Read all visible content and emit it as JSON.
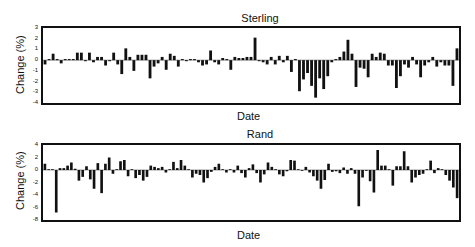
{
  "chart_data": [
    {
      "type": "bar",
      "title": "Sterling",
      "xlabel": "Date",
      "ylabel": "Change (%)",
      "ylim": [
        -4,
        3
      ],
      "yticks": [
        "3",
        "2",
        "1",
        "0",
        "-1",
        "-2",
        "-3",
        "-4"
      ],
      "grid": false,
      "legend": null,
      "values": [
        -0.4,
        0.1,
        0.6,
        0.1,
        -0.3,
        0.1,
        0.1,
        0.1,
        0.7,
        0.7,
        -0.1,
        0.7,
        -0.2,
        0.3,
        0.3,
        -0.5,
        -0.1,
        0.7,
        -0.4,
        -1.3,
        1.1,
        0.3,
        -1.0,
        0.5,
        0.5,
        0.5,
        -1.7,
        -0.6,
        -0.3,
        0.3,
        -0.9,
        0.6,
        0.4,
        -0.6,
        0.1,
        -0.1,
        0.1,
        0.1,
        -0.2,
        -0.5,
        -0.4,
        0.9,
        -0.2,
        -0.4,
        0.2,
        0.1,
        -0.9,
        0.3,
        0.2,
        0.2,
        0.3,
        0.3,
        2.1,
        -0.1,
        -0.2,
        -0.4,
        0.3,
        -0.4,
        0.4,
        -0.2,
        0.4,
        -1.1,
        0.1,
        -2.9,
        -1.8,
        -1.2,
        -2.4,
        -3.5,
        -1.7,
        -2.7,
        -1.5,
        -0.2,
        0.1,
        0.3,
        0.8,
        1.9,
        0.6,
        -2.5,
        -0.7,
        -0.8,
        -1.6,
        0.6,
        0.3,
        0.7,
        0.6,
        -0.5,
        -0.5,
        -2.6,
        -1.5,
        -0.4,
        -0.7,
        0.3,
        -0.4,
        -1.6,
        -0.5,
        -0.2,
        0.3,
        -0.6,
        -0.2,
        -0.5,
        -0.5,
        -2.4,
        1.1
      ]
    },
    {
      "type": "bar",
      "title": "Rand",
      "xlabel": "Date",
      "ylabel": "Change (%)",
      "ylim": [
        -8,
        4
      ],
      "yticks": [
        "4",
        "2",
        "0",
        "-2",
        "-4",
        "-6",
        "-8"
      ],
      "grid": false,
      "legend": null,
      "values": [
        1.0,
        0.0,
        0.0,
        -6.8,
        0.3,
        0.3,
        0.7,
        1.2,
        0.2,
        -1.7,
        -1.1,
        0.6,
        -1.5,
        -3.0,
        1.1,
        -3.7,
        1.0,
        2.0,
        -0.6,
        0.1,
        1.4,
        1.6,
        -1.0,
        0.0,
        -1.3,
        -0.8,
        -1.7,
        -1.1,
        0.7,
        0.5,
        0.3,
        0.5,
        -0.4,
        0.0,
        1.3,
        0.3,
        1.6,
        0.7,
        0.0,
        -1.2,
        -0.6,
        -0.8,
        -2.0,
        -1.3,
        -0.3,
        0.5,
        1.0,
        0.0,
        -0.4,
        0.0,
        -0.4,
        0.7,
        -0.5,
        -1.2,
        0.3,
        0.9,
        -0.5,
        -2.0,
        -0.7,
        1.2,
        0.5,
        0.0,
        -0.7,
        -1.0,
        -0.2,
        1.6,
        1.5,
        0.0,
        -0.1,
        0.5,
        -0.4,
        -1.0,
        -1.7,
        -3.0,
        -1.6,
        1.0,
        -0.3,
        -0.2,
        -0.5,
        0.4,
        -0.6,
        0.3,
        -0.6,
        -5.8,
        -1.2,
        -0.1,
        -1.8,
        -3.6,
        3.2,
        0.7,
        0.7,
        0.0,
        -2.5,
        0.6,
        0.6,
        3.0,
        0.6,
        -2.0,
        -1.2,
        -0.8,
        -0.6,
        0.0,
        1.5,
        -0.5,
        0.3,
        0.1,
        -0.8,
        -1.7,
        -2.8,
        -4.5
      ]
    }
  ]
}
